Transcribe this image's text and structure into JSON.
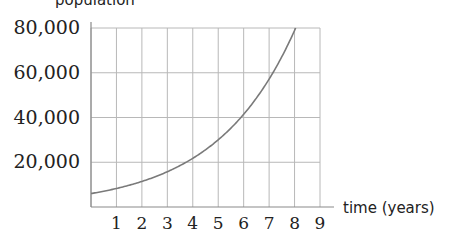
{
  "chart_data": {
    "type": "line",
    "title": "",
    "xlabel": "time (years)",
    "ylabel": "population",
    "x": [
      0,
      1,
      2,
      3,
      4,
      5,
      6,
      7,
      8,
      8.25
    ],
    "series": [
      {
        "name": "population",
        "values": [
          6000,
          8300,
          11400,
          15800,
          21800,
          30000,
          41400,
          57200,
          78900,
          80000
        ]
      }
    ],
    "xlim": [
      0,
      9
    ],
    "ylim": [
      0,
      80000
    ],
    "x_ticks": [
      "1",
      "2",
      "3",
      "4",
      "5",
      "6",
      "7",
      "8",
      "9"
    ],
    "y_ticks": [
      "20,000",
      "40,000",
      "60,000",
      "80,000"
    ],
    "grid": true,
    "legend": "none"
  },
  "colors": {
    "grid": "#b8b8b8",
    "curve": "#7a7a7a",
    "axis": "#8a8a8a",
    "text": "#222222"
  }
}
